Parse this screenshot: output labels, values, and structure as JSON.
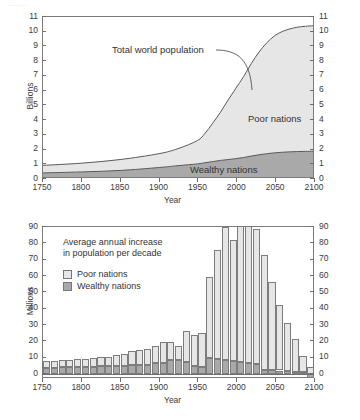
{
  "page": {
    "header_artifact": "——   ··········",
    "credit": "© Cengage Learning 2015"
  },
  "chart_data": [
    {
      "id": "world-population-area",
      "type": "area",
      "title": "",
      "xlabel": "Year",
      "ylabel": "Billions",
      "xlim": [
        1750,
        2100
      ],
      "ylim": [
        0,
        11
      ],
      "xticks": [
        1750,
        1800,
        1850,
        1900,
        1950,
        2000,
        2050,
        2100
      ],
      "xtick_labels": [
        "1750",
        "1800",
        "1850",
        "1900",
        "1950",
        "2000",
        "2050",
        "2100"
      ],
      "yticks": [
        0,
        1,
        2,
        3,
        4,
        5,
        6,
        7,
        8,
        9,
        10,
        11
      ],
      "ytick_labels": [
        "0",
        "1",
        "2",
        "3",
        "4",
        "5",
        "6",
        "7",
        "8",
        "9",
        "10",
        "11"
      ],
      "dual_y_axis": true,
      "grid": false,
      "stacked": true,
      "legend_position": "in-plot-labels",
      "annotations": [
        {
          "text": "Total world population",
          "x": 1940,
          "y": 8.5,
          "leader": true
        }
      ],
      "x": [
        1750,
        1800,
        1850,
        1900,
        1925,
        1950,
        1960,
        1970,
        1980,
        1990,
        2000,
        2010,
        2020,
        2030,
        2040,
        2050,
        2060,
        2070,
        2080,
        2090,
        2100
      ],
      "series": [
        {
          "name": "Wealthy nations",
          "color": "#a9a9a9",
          "values": [
            0.28,
            0.35,
            0.45,
            0.65,
            0.78,
            0.9,
            0.98,
            1.06,
            1.14,
            1.2,
            1.26,
            1.34,
            1.44,
            1.53,
            1.6,
            1.66,
            1.7,
            1.73,
            1.75,
            1.76,
            1.77
          ]
        },
        {
          "name": "Poor nations",
          "color": "#e6e6e6",
          "values": [
            0.52,
            0.6,
            0.75,
            0.95,
            1.17,
            1.6,
            2.02,
            2.64,
            3.31,
            4.1,
            4.84,
            5.56,
            6.36,
            7.06,
            7.62,
            8.04,
            8.3,
            8.45,
            8.55,
            8.6,
            8.63
          ]
        }
      ],
      "totals": [
        0.8,
        0.95,
        1.2,
        1.6,
        1.95,
        2.5,
        3.0,
        3.7,
        4.45,
        5.3,
        6.1,
        6.9,
        7.8,
        8.59,
        9.22,
        9.7,
        10.0,
        10.18,
        10.3,
        10.36,
        10.4
      ],
      "total_label": "Total world population"
    },
    {
      "id": "annual-increase-bars",
      "type": "bar",
      "title": "Average annual increase in population per decade",
      "title_lines": [
        "Average annual increase",
        "in population per decade"
      ],
      "xlabel": "Year",
      "ylabel": "Millions",
      "xlim": [
        1750,
        2100
      ],
      "ylim": [
        -3,
        90
      ],
      "xticks": [
        1750,
        1800,
        1850,
        1900,
        1950,
        2000,
        2050,
        2100
      ],
      "xtick_labels": [
        "1750",
        "1800",
        "1850",
        "1900",
        "1950",
        "2000",
        "2050",
        "2100"
      ],
      "yticks": [
        0,
        10,
        20,
        30,
        40,
        50,
        60,
        70,
        80,
        90
      ],
      "ytick_labels": [
        "0",
        "10",
        "20",
        "30",
        "40",
        "50",
        "60",
        "70",
        "80",
        "90"
      ],
      "dual_y_axis": true,
      "grid": false,
      "stacked": true,
      "legend_position": "upper-left",
      "legend": [
        {
          "label": "Poor nations",
          "color": "#e6e6e6"
        },
        {
          "label": "Wealthy nations",
          "color": "#a9a9a9"
        }
      ],
      "categories": [
        1750,
        1760,
        1770,
        1780,
        1790,
        1800,
        1810,
        1820,
        1830,
        1840,
        1850,
        1860,
        1870,
        1880,
        1890,
        1900,
        1910,
        1920,
        1930,
        1940,
        1950,
        1960,
        1970,
        1980,
        1990,
        2000,
        2010,
        2020,
        2030,
        2040,
        2050,
        2060,
        2070,
        2080,
        2090
      ],
      "series": [
        {
          "name": "Poor nations",
          "color": "#e6e6e6",
          "values": [
            4.2,
            4.0,
            4.5,
            4.5,
            5.0,
            5.0,
            5.2,
            5.6,
            5.6,
            6.5,
            7.5,
            8.5,
            9.0,
            9.5,
            10.8,
            12.5,
            11.0,
            8.5,
            19.0,
            19.0,
            20.5,
            49.5,
            67.0,
            81.0,
            74.0,
            88.0,
            84.5,
            82.5,
            70.5,
            54.0,
            40.0,
            29.5,
            20.0,
            10.0,
            4.5
          ]
        },
        {
          "name": "Wealthy nations",
          "color": "#a9a9a9",
          "values": [
            4.0,
            3.8,
            4.2,
            4.2,
            4.5,
            4.5,
            4.5,
            4.8,
            4.8,
            5.0,
            5.0,
            5.5,
            5.5,
            5.8,
            6.5,
            7.0,
            8.5,
            8.5,
            7.5,
            4.8,
            4.5,
            10.0,
            9.2,
            8.8,
            8.0,
            7.5,
            6.5,
            6.0,
            2.5,
            2.5,
            2.2,
            2.0,
            1.5,
            1.2,
            -2.5
          ]
        }
      ],
      "note": "Far-right bar (2090) dips below zero for wealthy nations."
    }
  ]
}
